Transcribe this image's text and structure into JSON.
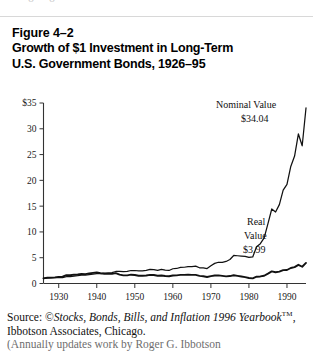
{
  "top_remnant": "o   o",
  "figure": {
    "number": "Figure 4–2",
    "title_line1": "Growth of $1 Investment in Long-Term",
    "title_line2": "U.S. Government Bonds, 1926–95"
  },
  "source": {
    "prefix": "Source: ©",
    "italic1": "Stocks, Bonds, Bills, and Inflation 1996",
    "italic2": "Yearbook",
    "tm": "TM",
    "rest": ", Ibbotson Associates, Chicago.",
    "clipped_line": "(Annually updates work by Roger G. Ibbotson"
  },
  "annotations": {
    "nominal_label": "Nominal Value",
    "nominal_value": "$34.04",
    "real_label_line1": "Real",
    "real_label_line2": "Value",
    "real_value": "$3.99"
  },
  "chart_data": {
    "type": "line",
    "title": "Growth of $1 Investment in Long-Term U.S. Government Bonds, 1926–95",
    "xlabel": "",
    "ylabel": "",
    "xlim": [
      1926,
      1995
    ],
    "ylim": [
      0,
      35
    ],
    "yticks": [
      0,
      5,
      10,
      15,
      20,
      25,
      30,
      35
    ],
    "ytick_labels": [
      "0",
      "5",
      "10",
      "15",
      "20",
      "25",
      "30",
      "$35"
    ],
    "xticks": [
      1930,
      1940,
      1950,
      1960,
      1970,
      1980,
      1990
    ],
    "xtick_labels": [
      "1930",
      "1940",
      "1950",
      "1960",
      "1970",
      "1980",
      "1990"
    ],
    "grid": false,
    "legend": "annotated-inline",
    "series": [
      {
        "name": "Nominal Value",
        "end_value": 34.04,
        "x": [
          1926,
          1927,
          1928,
          1929,
          1930,
          1931,
          1932,
          1933,
          1934,
          1935,
          1936,
          1937,
          1938,
          1939,
          1940,
          1941,
          1942,
          1943,
          1944,
          1945,
          1946,
          1947,
          1948,
          1949,
          1950,
          1951,
          1952,
          1953,
          1954,
          1955,
          1956,
          1957,
          1958,
          1959,
          1960,
          1961,
          1962,
          1963,
          1964,
          1965,
          1966,
          1967,
          1968,
          1969,
          1970,
          1971,
          1972,
          1973,
          1974,
          1975,
          1976,
          1977,
          1978,
          1979,
          1980,
          1981,
          1982,
          1983,
          1984,
          1985,
          1986,
          1987,
          1988,
          1989,
          1990,
          1991,
          1992,
          1993,
          1994,
          1995
        ],
        "values": [
          1.0,
          1.09,
          1.09,
          1.13,
          1.18,
          1.12,
          1.31,
          1.31,
          1.44,
          1.51,
          1.62,
          1.62,
          1.71,
          1.8,
          1.91,
          1.93,
          1.99,
          2.04,
          2.1,
          2.33,
          2.33,
          2.28,
          2.36,
          2.52,
          2.52,
          2.43,
          2.46,
          2.55,
          2.74,
          2.7,
          2.55,
          2.74,
          2.59,
          2.53,
          2.86,
          2.91,
          3.11,
          3.15,
          3.26,
          3.27,
          3.37,
          3.05,
          3.05,
          2.9,
          3.44,
          3.9,
          4.12,
          4.09,
          4.27,
          4.66,
          5.44,
          5.38,
          5.32,
          5.25,
          5.05,
          5.15,
          7.13,
          7.72,
          8.85,
          11.6,
          14.45,
          13.87,
          15.3,
          18.11,
          19.23,
          22.7,
          24.72,
          29.0,
          26.7,
          34.04
        ]
      },
      {
        "name": "Real Value",
        "end_value": 3.99,
        "x": [
          1926,
          1927,
          1928,
          1929,
          1930,
          1931,
          1932,
          1933,
          1934,
          1935,
          1936,
          1937,
          1938,
          1939,
          1940,
          1941,
          1942,
          1943,
          1944,
          1945,
          1946,
          1947,
          1948,
          1949,
          1950,
          1951,
          1952,
          1953,
          1954,
          1955,
          1956,
          1957,
          1958,
          1959,
          1960,
          1961,
          1962,
          1963,
          1964,
          1965,
          1966,
          1967,
          1968,
          1969,
          1970,
          1971,
          1972,
          1973,
          1974,
          1975,
          1976,
          1977,
          1978,
          1979,
          1980,
          1981,
          1982,
          1983,
          1984,
          1985,
          1986,
          1987,
          1988,
          1989,
          1990,
          1991,
          1992,
          1993,
          1994,
          1995
        ],
        "values": [
          1.0,
          1.12,
          1.13,
          1.18,
          1.28,
          1.34,
          1.6,
          1.59,
          1.71,
          1.75,
          1.86,
          1.81,
          1.95,
          2.05,
          2.16,
          2.0,
          1.9,
          1.87,
          1.86,
          2.01,
          1.73,
          1.57,
          1.58,
          1.71,
          1.65,
          1.5,
          1.5,
          1.55,
          1.67,
          1.64,
          1.51,
          1.56,
          1.45,
          1.4,
          1.56,
          1.58,
          1.67,
          1.67,
          1.7,
          1.68,
          1.68,
          1.47,
          1.4,
          1.26,
          1.42,
          1.54,
          1.58,
          1.48,
          1.39,
          1.44,
          1.59,
          1.48,
          1.36,
          1.23,
          1.06,
          1.0,
          1.31,
          1.37,
          1.51,
          1.92,
          2.35,
          2.18,
          2.3,
          2.6,
          2.62,
          3.0,
          3.17,
          3.62,
          3.25,
          3.99
        ]
      }
    ]
  }
}
